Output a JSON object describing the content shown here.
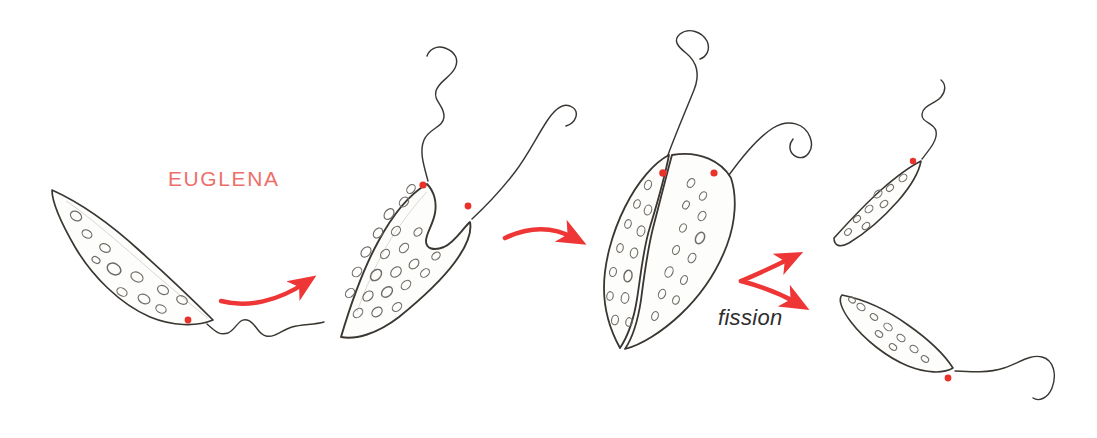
{
  "figure": {
    "title_label": "EUGLENA",
    "process_label": "fission",
    "background_color": "#ffffff",
    "ink_color": "#3a3632",
    "arrow_color": "#ef3636",
    "label_color": "#ee6f6a",
    "eyespot_color": "#e8322a",
    "organelle_color": "#6f6b66",
    "text_color": "#2e2e2e",
    "caption": "Hand-drawn pencil sequence showing a Euglena cell dividing by binary fission into two daughter cells.",
    "stages": [
      {
        "index": 1,
        "name": "single-cell",
        "description": "Intact spindle-shaped Euglena tilted down-right with one flagellum and one red eyespot.",
        "eyespots": 1,
        "flagella": 1,
        "organelle_count": 11
      },
      {
        "index": 2,
        "name": "early-division",
        "description": "Cell with a notch at the anterior end, two flagella and two red eyespots; nucleus has divided.",
        "eyespots": 2,
        "flagella": 2,
        "organelle_count": 22
      },
      {
        "index": 3,
        "name": "cleavage-furrow",
        "description": "Deep longitudinal furrow splits the cell into two lobes still joined at the posterior tip.",
        "eyespots": 2,
        "flagella": 2,
        "organelle_count": 24
      },
      {
        "index": 4,
        "name": "daughter-cell-upper",
        "description": "Separated daughter cell oriented up-right with its own flagellum and eyespot.",
        "eyespots": 1,
        "flagella": 1,
        "organelle_count": 8
      },
      {
        "index": 5,
        "name": "daughter-cell-lower",
        "description": "Separated daughter cell oriented down-right with a long trailing flagellum and eyespot.",
        "eyespots": 1,
        "flagella": 1,
        "organelle_count": 9
      }
    ],
    "arrows": [
      {
        "index": 1,
        "name": "arrow-stage1-to-stage2",
        "direction": "right-up"
      },
      {
        "index": 2,
        "name": "arrow-stage2-to-stage3",
        "direction": "right"
      },
      {
        "index": 3,
        "name": "arrow-fission-upper",
        "direction": "right-up"
      },
      {
        "index": 4,
        "name": "arrow-fission-lower",
        "direction": "right-down"
      }
    ]
  }
}
